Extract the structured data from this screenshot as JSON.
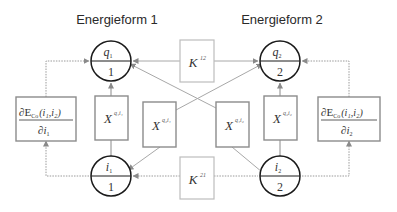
{
  "titles": {
    "left": "Energieform 1",
    "right": "Energieform 2"
  },
  "nodes": {
    "q1": {
      "top": "q",
      "top_sub": "1",
      "bottom": "1"
    },
    "q2": {
      "top": "q",
      "top_sub": "2",
      "bottom": "2"
    },
    "i1": {
      "top": "i",
      "top_sub": "1",
      "bottom": "1"
    },
    "i2": {
      "top": "i",
      "top_sub": "2",
      "bottom": "2"
    }
  },
  "coupling": {
    "k12": {
      "base": "K",
      "sup": "12"
    },
    "k21": {
      "base": "K",
      "sup": "21"
    }
  },
  "transfer": {
    "x_q1i1": {
      "base": "X",
      "sup": "q₁i₁"
    },
    "x_q2i1": {
      "base": "X",
      "sup": "q₂i₁"
    },
    "x_q1i2": {
      "base": "X",
      "sup": "q₁i₂"
    },
    "x_q2i2": {
      "base": "X",
      "sup": "q₂i₂"
    }
  },
  "derivatives": {
    "left": {
      "numerator": "∂E",
      "num_sub": "Co",
      "num_args": "(i₁,i₂)",
      "denominator": "∂i",
      "den_sub": "1"
    },
    "right": {
      "numerator": "∂E",
      "num_sub": "Co",
      "num_args": "(i₁,i₂)",
      "denominator": "∂i",
      "den_sub": "2"
    }
  },
  "colors": {
    "circle_stroke": "#1a1a1a",
    "box_stroke": "#8c8c8c",
    "k_box_stroke": "#bdbdbd",
    "connector": "#a8a8a8"
  }
}
